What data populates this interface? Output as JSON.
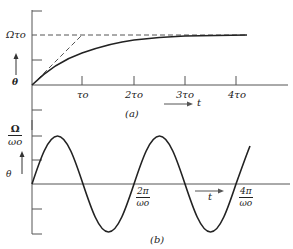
{
  "panel_a": {
    "caption": "(a)",
    "y_axis_label": "θ",
    "asymptote_label": "Ωτo",
    "x_axis_label": "t",
    "x_ticks": [
      "τo",
      "2τo",
      "3τo",
      "4τo"
    ],
    "curves": [
      {
        "name": "response",
        "style": "solid",
        "description": "θ = Ωτo(1 − e^(−t/τo))"
      },
      {
        "name": "asymptote",
        "style": "dashed",
        "description": "θ = Ωτo"
      },
      {
        "name": "initial-slope",
        "style": "dashed",
        "description": "tangent at origin, slope Ω, reaching Ωτo at t = τo"
      }
    ]
  },
  "panel_b": {
    "caption": "(b)",
    "y_axis_label": "θ",
    "amplitude_label_num": "Ω",
    "amplitude_label_den": "ωo",
    "x_axis_label": "t",
    "x_ticks": [
      {
        "num": "2π",
        "den": "ωo"
      },
      {
        "num": "4π",
        "den": "ωo"
      }
    ],
    "curves": [
      {
        "name": "oscillation",
        "style": "solid",
        "description": "θ = (Ω/ωo) sin(ωo t)"
      }
    ]
  },
  "colors": {
    "ink": "#222222",
    "axis": "#555555",
    "background": "#ffffff"
  }
}
